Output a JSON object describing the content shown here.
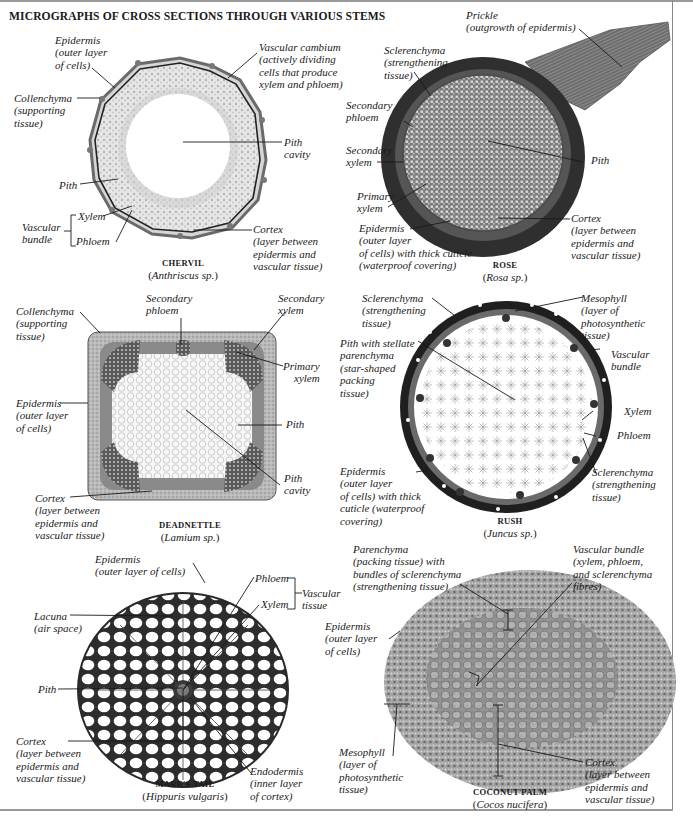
{
  "title": "MICROGRAPHS OF CROSS SECTIONS THROUGH VARIOUS STEMS",
  "colors": {
    "ink": "#1a1a1a",
    "frame": "#9a9a9a",
    "tissue_dark": "#3a3a3a",
    "tissue_mid": "#8a8a8a",
    "tissue_light": "#cfcfcf"
  },
  "specimens": {
    "chervil": {
      "common_name": "CHERVIL",
      "scientific_pre": "(",
      "scientific": "Anthriscus sp.",
      "scientific_post": ")",
      "labels": {
        "epidermis": "Epidermis\n(outer layer\nof cells)",
        "vascular_cambium": "Vascular cambium\n(actively dividing\ncells that produce\nxylem and phloem)",
        "collenchyma": "Collenchyma\n(supporting\ntissue)",
        "pith_cavity": "Pith\ncavity",
        "pith": "Pith",
        "xylem": "Xylem",
        "vascular_bundle": "Vascular\nbundle",
        "phloem": "Phloem",
        "cortex": "Cortex\n(layer between\nepidermis and\nvascular tissue)"
      }
    },
    "rose": {
      "common_name": "ROSE",
      "scientific_pre": "(",
      "scientific": "Rosa sp.",
      "scientific_post": ")",
      "labels": {
        "prickle": "Prickle\n(outgrowth of epidermis)",
        "sclerenchyma": "Sclerenchyma\n(strengthening\ntissue)",
        "secondary_phloem": "Secondary\nphloem",
        "secondary_xylem": "Secondary\nxylem",
        "pith": "Pith",
        "primary_xylem": "Primary\nxylem",
        "epidermis": "Epidermis\n(outer layer\nof cells) with thick cuticle\n(waterproof covering)",
        "cortex": "Cortex\n(layer between\nepidermis and\nvascular tissue)"
      }
    },
    "deadnettle": {
      "common_name": "DEADNETTLE",
      "scientific_pre": "(",
      "scientific": "Lamium sp.",
      "scientific_post": ")",
      "labels": {
        "collenchyma": "Collenchyma\n(supporting\ntissue)",
        "secondary_phloem": "Secondary\nphloem",
        "secondary_xylem": "Secondary\nxylem",
        "primary_xylem": "Primary\nxylem",
        "epidermis": "Epidermis\n(outer layer\nof cells)",
        "pith": "Pith",
        "pith_cavity": "Pith\ncavity",
        "cortex": "Cortex\n(layer between\nepidermis and\nvascular tissue)"
      }
    },
    "rush": {
      "common_name": "RUSH",
      "scientific_pre": "(",
      "scientific": "Juncus sp.",
      "scientific_post": ")",
      "labels": {
        "sclerenchyma_top": "Sclerenchyma\n(strengthening\ntissue)",
        "mesophyll": "Mesophyll\n(layer of\nphotosynthetic\ntissue)",
        "pith": "Pith with stellate\nparenchyma\n(star-shaped\npacking\ntissue)",
        "vascular_bundle": "Vascular\nbundle",
        "xylem": "Xylem",
        "phloem": "Phloem",
        "epidermis": "Epidermis\n(outer layer\nof cells) with thick\ncuticle (waterproof\ncovering)",
        "sclerenchyma_bottom": "Sclerenchyma\n(strengthening\ntissue)"
      }
    },
    "mares_tail": {
      "common_name": "MARE'S TAIL",
      "scientific_pre": "(",
      "scientific": "Hippuris vulgaris",
      "scientific_post": ")",
      "labels": {
        "epidermis": "Epidermis\n(outer layer of cells)",
        "phloem": "Phloem",
        "xylem": "Xylem",
        "vascular_tissue": "Vascular\ntissue",
        "lacuna": "Lacuna\n(air space)",
        "pith": "Pith",
        "cortex": "Cortex\n(layer between\nepidermis and\nvascular tissue)",
        "endodermis": "Endodermis\n(inner layer\nof cortex)"
      }
    },
    "coconut_palm": {
      "common_name": "COCONUT PALM",
      "scientific_pre": "(",
      "scientific": "Cocos nucifera",
      "scientific_post": ")",
      "labels": {
        "parenchyma": "Parenchyma\n(packing tissue) with\nbundles of sclerenchyma\n(strengthening tissue)",
        "vascular_bundle": "Vascular bundle\n(xylem, phloem,\nand sclerenchyma\nfibres)",
        "epidermis": "Epidermis\n(outer layer\nof cells)",
        "mesophyll": "Mesophyll\n(layer of\nphotosynthetic\ntissue)",
        "cortex": "Cortex\n(layer between\nepidermis and\nvascular tissue)"
      }
    }
  }
}
